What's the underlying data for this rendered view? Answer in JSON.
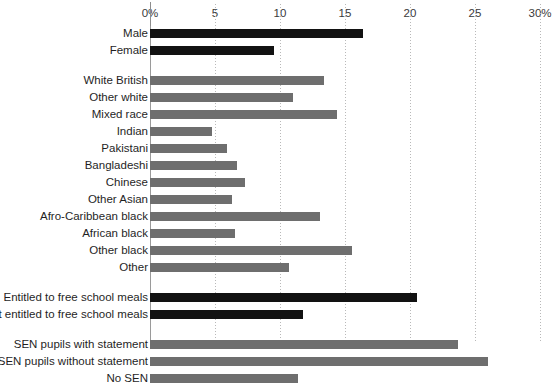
{
  "chart_data": {
    "type": "bar",
    "orientation": "horizontal",
    "title": "",
    "subtitle": "",
    "xlabel": "",
    "ylabel": "",
    "xlim": [
      0,
      30
    ],
    "grid": true,
    "legend": false,
    "legend_position": "none",
    "xtick_labels": [
      "0%",
      "5",
      "10",
      "15",
      "20",
      "25",
      "30%"
    ],
    "xticks": [
      0,
      5,
      10,
      15,
      20,
      25,
      30
    ],
    "colors": {
      "dark_series": "#121212",
      "gray_series": "#6e6e6e",
      "gridline": "#b9b9b9",
      "axis": "#9a9a9a",
      "text": "#1f1f1f"
    },
    "groups": [
      {
        "name": "Gender",
        "color": "#121212",
        "categories": [
          "Male",
          "Female"
        ],
        "values": [
          16.4,
          9.5
        ]
      },
      {
        "name": "Ethnicity",
        "color": "#6e6e6e",
        "categories": [
          "White British",
          "Other white",
          "Mixed race",
          "Indian",
          "Pakistani",
          "Bangladeshi",
          "Chinese",
          "Other Asian",
          "Afro-Caribbean black",
          "African black",
          "Other black",
          "Other"
        ],
        "values": [
          13.4,
          11.0,
          14.4,
          4.8,
          5.9,
          6.7,
          7.3,
          6.3,
          13.1,
          6.5,
          15.5,
          10.7
        ]
      },
      {
        "name": "Free school meals",
        "color": "#121212",
        "categories": [
          "Entitled to free school meals",
          "Not entitled to free school meals"
        ],
        "values": [
          20.5,
          11.8
        ]
      },
      {
        "name": "Special educational needs",
        "color": "#6e6e6e",
        "categories": [
          "SEN pupils with statement",
          "SEN pupils without statement",
          "No SEN"
        ],
        "values": [
          23.7,
          26.0,
          11.4
        ]
      }
    ],
    "categories": [
      "Male",
      "Female",
      "White British",
      "Other white",
      "Mixed race",
      "Indian",
      "Pakistani",
      "Bangladeshi",
      "Chinese",
      "Other Asian",
      "Afro-Caribbean black",
      "African black",
      "Other black",
      "Other",
      "Entitled to free school meals",
      "Not entitled to free school meals",
      "SEN pupils with statement",
      "SEN pupils without statement",
      "No SEN"
    ],
    "values": [
      16.4,
      9.5,
      13.4,
      11.0,
      14.4,
      4.8,
      5.9,
      6.7,
      7.3,
      6.3,
      13.1,
      6.5,
      15.5,
      10.7,
      20.5,
      11.8,
      23.7,
      26.0,
      11.4
    ]
  }
}
